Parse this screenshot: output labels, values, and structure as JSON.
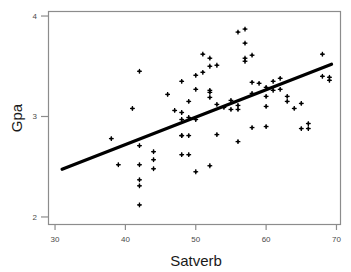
{
  "chart_data": {
    "type": "scatter",
    "title": "",
    "xlabel": "Satverb",
    "ylabel": "Gpa",
    "xlim": [
      29.0,
      70.5
    ],
    "ylim": [
      1.93,
      4.05
    ],
    "xticks": [
      30,
      40,
      50,
      60,
      70
    ],
    "yticks": [
      2,
      3,
      4
    ],
    "xticklabels": [
      "30",
      "40",
      "50",
      "60",
      "70"
    ],
    "yticklabels": [
      "2",
      "3",
      "4"
    ],
    "grid": false,
    "legend": null,
    "marker": "plus-dot",
    "marker_color": "#000000",
    "frame_color": "#8c8c8c",
    "background": "#ffffff",
    "series": [
      {
        "name": "students",
        "type": "scatter",
        "x": [
          38,
          39,
          41,
          42,
          42,
          42,
          42,
          42,
          42,
          44,
          44,
          44,
          46,
          47,
          48,
          48,
          48,
          48,
          48,
          48,
          49,
          49,
          49,
          49,
          50,
          50,
          50,
          50,
          51,
          51,
          52,
          52,
          52,
          52,
          52,
          52,
          53,
          53,
          53,
          54,
          55,
          55,
          56,
          56,
          56,
          56,
          57,
          57,
          57,
          57,
          58,
          58,
          58,
          58,
          59,
          60,
          60,
          60,
          60,
          61,
          61,
          62,
          62,
          63,
          63,
          64,
          65,
          65,
          66,
          66,
          68,
          68,
          69,
          69
        ],
        "y": [
          2.78,
          2.52,
          3.08,
          3.45,
          2.71,
          2.52,
          2.37,
          2.31,
          2.12,
          2.65,
          2.57,
          2.48,
          3.22,
          3.06,
          3.35,
          3.04,
          2.97,
          2.81,
          2.81,
          2.62,
          3.15,
          2.99,
          2.81,
          2.62,
          3.41,
          3.27,
          2.97,
          2.45,
          3.62,
          3.44,
          3.58,
          3.5,
          3.26,
          3.24,
          3.19,
          2.51,
          3.51,
          3.12,
          2.82,
          3.09,
          3.16,
          3.07,
          3.84,
          3.11,
          3.07,
          2.75,
          3.87,
          3.73,
          3.58,
          3.55,
          3.61,
          3.34,
          3.23,
          2.89,
          3.33,
          3.29,
          3.2,
          3.1,
          2.9,
          3.35,
          3.26,
          3.38,
          3.27,
          3.2,
          3.15,
          3.08,
          3.13,
          2.88,
          2.93,
          2.88,
          3.62,
          3.4,
          3.39,
          3.36
        ]
      },
      {
        "name": "regression-line",
        "type": "line",
        "x": [
          31.0,
          69.3
        ],
        "y": [
          2.475,
          3.52
        ]
      }
    ]
  }
}
